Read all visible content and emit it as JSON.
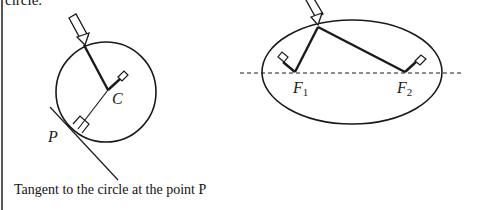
{
  "document": {
    "top_text_fragment": "circle.",
    "caption": "Tangent to the circle at the point P"
  },
  "circle_figure": {
    "labels": {
      "center": "C",
      "point": "P"
    }
  },
  "ellipse_figure": {
    "labels": {
      "focus1_main": "F",
      "focus1_sub": "1",
      "focus2_main": "F",
      "focus2_sub": "2"
    }
  },
  "colors": {
    "stroke": "#1a1a1a",
    "background": "#ffffff"
  }
}
